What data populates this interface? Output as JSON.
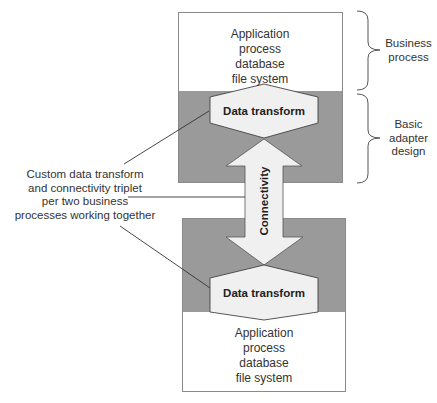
{
  "diagram": {
    "top_box": {
      "lines": [
        "Application",
        "process",
        "database",
        "file system"
      ]
    },
    "top_transform": {
      "label": "Data transform"
    },
    "connectivity": {
      "label": "Connectivity"
    },
    "bottom_transform": {
      "label": "Data transform"
    },
    "bottom_box": {
      "lines": [
        "Application",
        "process",
        "database",
        "file system"
      ]
    },
    "annotation": {
      "lines": [
        "Custom data transform",
        "and connectivity triplet",
        "per two business",
        "processes working together"
      ]
    },
    "braces": [
      {
        "lines": [
          "Business",
          "process"
        ]
      },
      {
        "lines": [
          "Basic",
          "adapter",
          "design"
        ]
      }
    ],
    "colors": {
      "adapter_gray": "#9a9a9a",
      "shape_fill": "#f0f0f0",
      "box_border": "#8a8a8a",
      "line": "#333333"
    }
  }
}
